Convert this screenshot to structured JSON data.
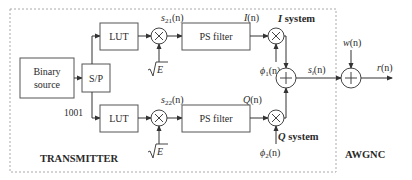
{
  "diagram": {
    "transmitter_label": "TRANSMITTER",
    "channel_label": "AWGNC",
    "blocks": {
      "binary_source_line1": "Binary",
      "binary_source_line2": "source",
      "sp": "S/P",
      "lut_top": "LUT",
      "lut_bottom": "LUT",
      "ps_filter_top": "PS filter",
      "ps_filter_bottom": "PS filter"
    },
    "signals": {
      "bits": "1001",
      "s21": "s",
      "s21_sub": "21",
      "s22": "s",
      "s22_sub": "22",
      "arg": "(n)",
      "sqrtE": "E",
      "I": "I",
      "Q": "Q",
      "phi1": "ϕ",
      "phi1_sub": "1",
      "phi2": "ϕ",
      "phi2_sub": "2",
      "si": "s",
      "si_sub": "i",
      "w": "w",
      "r": "r"
    },
    "systems": {
      "i_system_sym": "I",
      "i_system_word": " system",
      "q_system_sym": "Q",
      "q_system_word": " system"
    }
  }
}
